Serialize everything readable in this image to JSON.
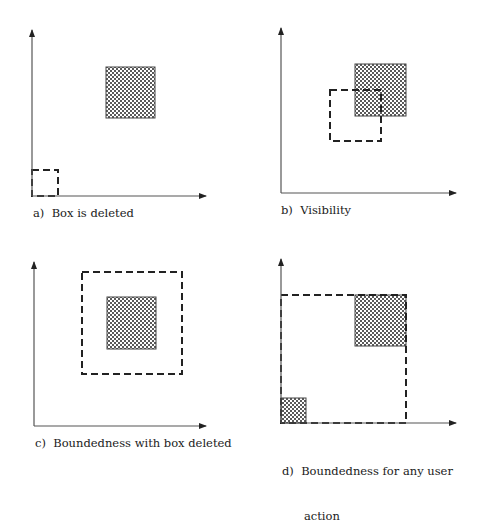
{
  "figure": {
    "colors": {
      "axis": "#555555",
      "dash": "#222222",
      "shade_dark": "#5a5a5a",
      "shade_light": "#ffffff",
      "border": "#444444"
    },
    "panels": [
      {
        "id": "a",
        "caption": "a)  Box is deleted",
        "caption_pos": [
          33,
          206
        ],
        "axes": {
          "origin": [
            32,
            196
          ],
          "y_top": 30,
          "x_right": 206
        },
        "shaded_boxes": [
          {
            "x": 106,
            "y": 67,
            "w": 49,
            "h": 51
          }
        ],
        "dashed_boxes": [
          {
            "x": 32,
            "y": 170,
            "w": 26,
            "h": 26
          }
        ]
      },
      {
        "id": "b",
        "caption": "b)  Visibility",
        "caption_pos": [
          281,
          203
        ],
        "axes": {
          "origin": [
            281,
            193
          ],
          "y_top": 28,
          "x_right": 456
        },
        "shaded_boxes": [
          {
            "x": 355,
            "y": 64,
            "w": 51,
            "h": 52
          }
        ],
        "dashed_boxes": [
          {
            "x": 330,
            "y": 90,
            "w": 51,
            "h": 51
          }
        ]
      },
      {
        "id": "c",
        "caption": "c)  Boundedness with box deleted",
        "caption_pos": [
          35,
          436
        ],
        "axes": {
          "origin": [
            34,
            426
          ],
          "y_top": 262,
          "x_right": 206
        },
        "shaded_boxes": [
          {
            "x": 107,
            "y": 297,
            "w": 49,
            "h": 52
          }
        ],
        "dashed_boxes": [
          {
            "x": 82,
            "y": 272,
            "w": 100,
            "h": 102
          }
        ]
      },
      {
        "id": "d",
        "caption_lines": [
          "d)  Boundedness for any user",
          "      action"
        ],
        "caption_pos": [
          282,
          434
        ],
        "axes": {
          "origin": [
            281,
            423
          ],
          "y_top": 259,
          "x_right": 456
        },
        "shaded_boxes": [
          {
            "x": 355,
            "y": 295,
            "w": 51,
            "h": 51
          },
          {
            "x": 281,
            "y": 398,
            "w": 25,
            "h": 25
          }
        ],
        "dashed_boxes": [
          {
            "x": 281,
            "y": 295,
            "w": 125,
            "h": 128
          }
        ]
      }
    ]
  }
}
